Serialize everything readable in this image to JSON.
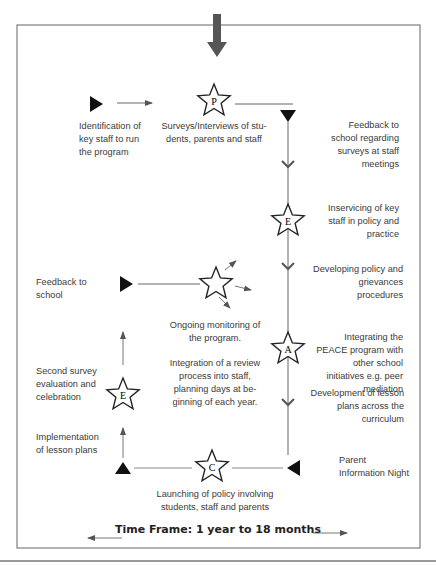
{
  "diagram": {
    "stages": [
      {
        "letter": "P",
        "label": "Surveys/Interviews of stu-\ndents, parents and staff"
      },
      {
        "letter": "E",
        "label": "Inservicing of key staff in policy and practice"
      },
      {
        "letter": "A",
        "label": "Integrating the PEACE program with other school initiatives e.g. peer mediation"
      },
      {
        "letter": "C",
        "label": "Launching of policy involving students, staff and parents"
      },
      {
        "letter": "E",
        "label": "Second survey evaluation and celebration"
      },
      {
        "letter": "",
        "label": "Ongoing monitoring of the program."
      }
    ],
    "steps": {
      "identification": "Identification of key staff to run the program",
      "feedback_surveys": "Feedback to school regarding surveys at staff meetings",
      "developing_policy": "Developing policy and grievances procedures",
      "development_lessons": "Development of lesson plans across the curriculum",
      "parent_night": "Parent Information Night",
      "implementation": "Implementation of lesson plans",
      "feedback_school": "Feedback to school",
      "integration_review": "Integration of a review process into staff, planning days at be-ginning of each year."
    },
    "letters": {
      "p": "P",
      "e1": "E",
      "a": "A",
      "c": "C",
      "e2": "E"
    },
    "time_frame": "Time Frame: 1 year to 18 months",
    "colors": {
      "line": "#555555",
      "marker": "#111111",
      "entry_arrow": "#555555"
    }
  }
}
